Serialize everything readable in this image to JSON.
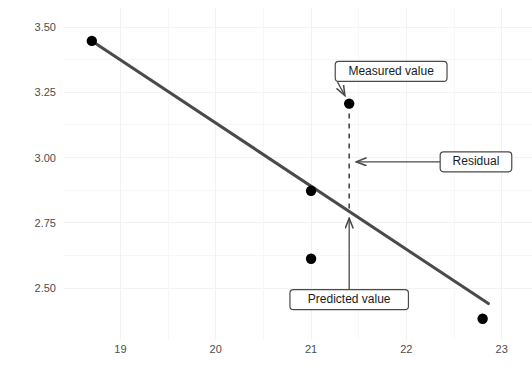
{
  "chart_data": {
    "type": "scatter",
    "title": "",
    "subtitle": "",
    "xlabel": "",
    "ylabel": "",
    "xlim": [
      18.45,
      23.15
    ],
    "ylim": [
      2.34,
      3.55
    ],
    "xticks": [
      19,
      20,
      21,
      22,
      23
    ],
    "xtick_labels": [
      "19",
      "20",
      "21",
      "22",
      "23"
    ],
    "yticks": [
      2.5,
      2.75,
      3.0,
      3.25,
      3.5
    ],
    "ytick_labels": [
      "2.50",
      "2.75",
      "3.00",
      "3.25",
      "3.50"
    ],
    "grid": true,
    "legend": "none",
    "points": [
      {
        "x": 18.7,
        "y": 3.447
      },
      {
        "x": 21.0,
        "y": 2.873
      },
      {
        "x": 21.0,
        "y": 2.613
      },
      {
        "x": 21.4,
        "y": 3.207
      },
      {
        "x": 22.8,
        "y": 2.383
      }
    ],
    "series": [
      {
        "name": "regression line",
        "type": "line",
        "x": [
          18.7,
          22.86
        ],
        "y": [
          3.447,
          2.441
        ],
        "color": "#4a4a4a"
      }
    ],
    "annotations": [
      {
        "id": "measured-value",
        "label": "Measured value",
        "box_x": 21.84,
        "box_y": 3.33,
        "target_x": 21.4,
        "target_y": 3.207,
        "arrow": "to-point"
      },
      {
        "id": "residual",
        "label": "Residual",
        "box_x": 22.73,
        "box_y": 2.984,
        "target_x": 21.4,
        "target_y": 2.984,
        "arrow": "to-left"
      },
      {
        "id": "predicted-value",
        "label": "Predicted value",
        "box_x": 21.4,
        "box_y": 2.456,
        "target_x": 21.4,
        "target_y": 2.795,
        "arrow": "to-up"
      }
    ],
    "residual_segment": {
      "x": 21.4,
      "y_top": 3.207,
      "y_bottom": 2.795,
      "style": "dashed"
    },
    "colors": {
      "point": "#000000",
      "line": "#4a4a4a",
      "grid": "#f2f2f2",
      "background": "#ffffff",
      "tick_text": "#4d4d4d",
      "callout_border": "#4a4a4a",
      "callout_text": "#1a1a1a"
    }
  }
}
